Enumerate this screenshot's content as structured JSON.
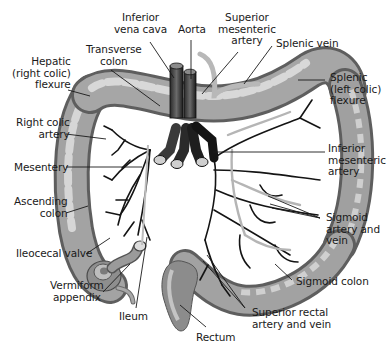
{
  "diagram": {
    "colors": {
      "background": "#ffffff",
      "colon_fill": "#9a9a9a",
      "colon_highlight": "#d4d4d4",
      "colon_shadow": "#5e5e5e",
      "vessel_dark": "#141414",
      "vessel_light": "#b8b8b8",
      "leader_line": "#1a1a1a",
      "label_text": "#1a1a1a"
    },
    "labels": {
      "inferior_vena_cava": "Inferior\nvena cava",
      "aorta": "Aorta",
      "superior_mesenteric_artery": "Superior\nmesenteric\nartery",
      "splenic_vein": "Splenic vein",
      "transverse_colon": "Transverse\ncolon",
      "hepatic_flexure": "Hepatic\n(right colic)\nflexure",
      "splenic_flexure": "Splenic\n(left colic)\nflexure",
      "right_colic_artery": "Right colic\nartery",
      "mesentery": "Mesentery",
      "inferior_mesenteric_artery": "Inferior\nmesenteric\nartery",
      "ascending_colon": "Ascending\ncolon",
      "sigmoid_artery_and_vein": "Sigmoid\nartery and\nvein",
      "ileocecal_valve": "Ileocecal valve",
      "vermiform_appendix": "Vermiform\nappendix",
      "sigmoid_colon": "Sigmoid colon",
      "ileum": "Ileum",
      "superior_rectal_artery_and_vein": "Superior rectal\nartery and vein",
      "rectum": "Rectum"
    }
  }
}
